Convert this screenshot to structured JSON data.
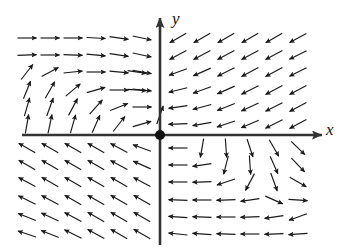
{
  "figure": {
    "type": "direction-field",
    "axes": {
      "x_label": "x",
      "y_label": "y",
      "x_axis": {
        "x1": 22,
        "y1": 135,
        "x2": 322,
        "y2": 135,
        "arrow_end": "right"
      },
      "y_axis": {
        "x1": 160,
        "y1": 245,
        "x2": 160,
        "y2": 18,
        "arrow_end": "up"
      },
      "origin": {
        "x": 160,
        "y": 135
      }
    },
    "equilibrium_point": {
      "x": 160,
      "y": 135,
      "radius": 5,
      "color": "#111111",
      "filled": true
    },
    "colors": {
      "axis": "#333333",
      "arrow": "#1a1a1a",
      "background": "#ffffff"
    },
    "grid": {
      "q1_cols": [
        178,
        202,
        226,
        250,
        274,
        298
      ],
      "q1_rows": [
        38,
        55,
        72,
        90,
        107,
        124
      ],
      "q2_cols": [
        27,
        50,
        73,
        96,
        119,
        142
      ],
      "q2_rows": [
        38,
        55,
        72,
        90,
        107,
        124
      ],
      "q3_cols": [
        27,
        50,
        73,
        96,
        119,
        142
      ],
      "q3_rows": [
        148,
        165,
        182,
        200,
        217,
        234
      ],
      "q4_cols": [
        178,
        202,
        226,
        250,
        274,
        298
      ],
      "q4_rows": [
        148,
        165,
        182,
        200,
        217,
        234
      ]
    },
    "arrow_length": 19,
    "arrow_head_size": 5,
    "spiral_centers": [
      {
        "quadrant": "II",
        "x": 72,
        "y": 86,
        "sense": "counterclockwise"
      },
      {
        "quadrant": "IV",
        "x": 258,
        "y": 190,
        "sense": "counterclockwise"
      }
    ]
  },
  "chart_data": {
    "type": "scatter",
    "title": "",
    "xlabel": "x",
    "ylabel": "y",
    "xlim": [
      -7,
      7
    ],
    "ylim": [
      -6,
      6
    ],
    "grid": false,
    "legend": null,
    "field_vectors": [
      {
        "x": 27,
        "y": 38,
        "angle": 0
      },
      {
        "x": 50,
        "y": 38,
        "angle": 0
      },
      {
        "x": 73,
        "y": 38,
        "angle": 0
      },
      {
        "x": 96,
        "y": 38,
        "angle": 3
      },
      {
        "x": 119,
        "y": 38,
        "angle": 8
      },
      {
        "x": 142,
        "y": 38,
        "angle": 12
      },
      {
        "x": 27,
        "y": 55,
        "angle": -2
      },
      {
        "x": 50,
        "y": 55,
        "angle": 0
      },
      {
        "x": 73,
        "y": 55,
        "angle": 2
      },
      {
        "x": 96,
        "y": 55,
        "angle": 5
      },
      {
        "x": 119,
        "y": 55,
        "angle": 8
      },
      {
        "x": 142,
        "y": 55,
        "angle": 12
      },
      {
        "x": 27,
        "y": 72,
        "angle": -52
      },
      {
        "x": 50,
        "y": 72,
        "angle": -28
      },
      {
        "x": 73,
        "y": 72,
        "angle": -6
      },
      {
        "x": 96,
        "y": 72,
        "angle": 0
      },
      {
        "x": 119,
        "y": 72,
        "angle": 5
      },
      {
        "x": 142,
        "y": 72,
        "angle": 10
      },
      {
        "x": 27,
        "y": 90,
        "angle": -68
      },
      {
        "x": 50,
        "y": 90,
        "angle": -60
      },
      {
        "x": 73,
        "y": 90,
        "angle": -40
      },
      {
        "x": 96,
        "y": 90,
        "angle": -16
      },
      {
        "x": 119,
        "y": 90,
        "angle": 0
      },
      {
        "x": 142,
        "y": 90,
        "angle": 6
      },
      {
        "x": 27,
        "y": 107,
        "angle": -74
      },
      {
        "x": 50,
        "y": 107,
        "angle": -70
      },
      {
        "x": 73,
        "y": 107,
        "angle": -62
      },
      {
        "x": 96,
        "y": 107,
        "angle": -48
      },
      {
        "x": 119,
        "y": 107,
        "angle": -22
      },
      {
        "x": 142,
        "y": 107,
        "angle": 0
      },
      {
        "x": 27,
        "y": 124,
        "angle": -80
      },
      {
        "x": 50,
        "y": 124,
        "angle": -78
      },
      {
        "x": 73,
        "y": 124,
        "angle": -74
      },
      {
        "x": 96,
        "y": 124,
        "angle": -66
      },
      {
        "x": 119,
        "y": 124,
        "angle": -52
      },
      {
        "x": 142,
        "y": 124,
        "angle": -16
      },
      {
        "x": 178,
        "y": 38,
        "angle": 150
      },
      {
        "x": 202,
        "y": 38,
        "angle": 150
      },
      {
        "x": 226,
        "y": 38,
        "angle": 150
      },
      {
        "x": 250,
        "y": 38,
        "angle": 150
      },
      {
        "x": 274,
        "y": 38,
        "angle": 150
      },
      {
        "x": 298,
        "y": 38,
        "angle": 152
      },
      {
        "x": 178,
        "y": 55,
        "angle": 152
      },
      {
        "x": 202,
        "y": 55,
        "angle": 152
      },
      {
        "x": 226,
        "y": 55,
        "angle": 152
      },
      {
        "x": 250,
        "y": 55,
        "angle": 152
      },
      {
        "x": 274,
        "y": 55,
        "angle": 152
      },
      {
        "x": 298,
        "y": 55,
        "angle": 154
      },
      {
        "x": 178,
        "y": 72,
        "angle": 160
      },
      {
        "x": 202,
        "y": 72,
        "angle": 156
      },
      {
        "x": 226,
        "y": 72,
        "angle": 154
      },
      {
        "x": 250,
        "y": 72,
        "angle": 152
      },
      {
        "x": 274,
        "y": 72,
        "angle": 152
      },
      {
        "x": 298,
        "y": 72,
        "angle": 154
      },
      {
        "x": 178,
        "y": 90,
        "angle": 166
      },
      {
        "x": 202,
        "y": 90,
        "angle": 160
      },
      {
        "x": 226,
        "y": 90,
        "angle": 156
      },
      {
        "x": 250,
        "y": 90,
        "angle": 154
      },
      {
        "x": 274,
        "y": 90,
        "angle": 152
      },
      {
        "x": 298,
        "y": 90,
        "angle": 152
      },
      {
        "x": 178,
        "y": 107,
        "angle": 172
      },
      {
        "x": 202,
        "y": 107,
        "angle": 165
      },
      {
        "x": 226,
        "y": 107,
        "angle": 158
      },
      {
        "x": 250,
        "y": 107,
        "angle": 155
      },
      {
        "x": 274,
        "y": 107,
        "angle": 153
      },
      {
        "x": 298,
        "y": 107,
        "angle": 152
      },
      {
        "x": 178,
        "y": 124,
        "angle": 178
      },
      {
        "x": 202,
        "y": 124,
        "angle": 170
      },
      {
        "x": 226,
        "y": 124,
        "angle": 162
      },
      {
        "x": 250,
        "y": 124,
        "angle": 157
      },
      {
        "x": 274,
        "y": 124,
        "angle": 154
      },
      {
        "x": 298,
        "y": 124,
        "angle": 152
      },
      {
        "x": 27,
        "y": 148,
        "angle": -150
      },
      {
        "x": 50,
        "y": 148,
        "angle": -150
      },
      {
        "x": 73,
        "y": 148,
        "angle": -150
      },
      {
        "x": 96,
        "y": 148,
        "angle": -150
      },
      {
        "x": 119,
        "y": 148,
        "angle": -152
      },
      {
        "x": 142,
        "y": 148,
        "angle": -160
      },
      {
        "x": 27,
        "y": 165,
        "angle": -150
      },
      {
        "x": 50,
        "y": 165,
        "angle": -150
      },
      {
        "x": 73,
        "y": 165,
        "angle": -150
      },
      {
        "x": 96,
        "y": 165,
        "angle": -150
      },
      {
        "x": 119,
        "y": 165,
        "angle": -152
      },
      {
        "x": 142,
        "y": 165,
        "angle": -156
      },
      {
        "x": 27,
        "y": 182,
        "angle": -152
      },
      {
        "x": 50,
        "y": 182,
        "angle": -150
      },
      {
        "x": 73,
        "y": 182,
        "angle": -150
      },
      {
        "x": 96,
        "y": 182,
        "angle": -150
      },
      {
        "x": 119,
        "y": 182,
        "angle": -150
      },
      {
        "x": 142,
        "y": 182,
        "angle": -152
      },
      {
        "x": 27,
        "y": 200,
        "angle": -154
      },
      {
        "x": 50,
        "y": 200,
        "angle": -152
      },
      {
        "x": 73,
        "y": 200,
        "angle": -150
      },
      {
        "x": 96,
        "y": 200,
        "angle": -150
      },
      {
        "x": 119,
        "y": 200,
        "angle": -150
      },
      {
        "x": 142,
        "y": 200,
        "angle": -150
      },
      {
        "x": 27,
        "y": 217,
        "angle": -158
      },
      {
        "x": 50,
        "y": 217,
        "angle": -155
      },
      {
        "x": 73,
        "y": 217,
        "angle": -152
      },
      {
        "x": 96,
        "y": 217,
        "angle": -150
      },
      {
        "x": 119,
        "y": 217,
        "angle": -150
      },
      {
        "x": 142,
        "y": 217,
        "angle": -150
      },
      {
        "x": 27,
        "y": 234,
        "angle": -162
      },
      {
        "x": 50,
        "y": 234,
        "angle": -158
      },
      {
        "x": 73,
        "y": 234,
        "angle": -154
      },
      {
        "x": 96,
        "y": 234,
        "angle": -151
      },
      {
        "x": 119,
        "y": 234,
        "angle": -150
      },
      {
        "x": 142,
        "y": 234,
        "angle": -150
      },
      {
        "x": 178,
        "y": 148,
        "angle": 180
      },
      {
        "x": 202,
        "y": 148,
        "angle": 100
      },
      {
        "x": 226,
        "y": 148,
        "angle": 86
      },
      {
        "x": 250,
        "y": 148,
        "angle": 72
      },
      {
        "x": 274,
        "y": 148,
        "angle": 60
      },
      {
        "x": 298,
        "y": 148,
        "angle": 44
      },
      {
        "x": 178,
        "y": 165,
        "angle": 180
      },
      {
        "x": 202,
        "y": 165,
        "angle": 172
      },
      {
        "x": 226,
        "y": 165,
        "angle": 104
      },
      {
        "x": 250,
        "y": 165,
        "angle": 86
      },
      {
        "x": 274,
        "y": 165,
        "angle": 66
      },
      {
        "x": 298,
        "y": 165,
        "angle": 46
      },
      {
        "x": 178,
        "y": 182,
        "angle": 180
      },
      {
        "x": 202,
        "y": 182,
        "angle": 178
      },
      {
        "x": 226,
        "y": 182,
        "angle": 162
      },
      {
        "x": 250,
        "y": 182,
        "angle": 118
      },
      {
        "x": 274,
        "y": 182,
        "angle": 70
      },
      {
        "x": 298,
        "y": 182,
        "angle": 30
      },
      {
        "x": 178,
        "y": 200,
        "angle": 182
      },
      {
        "x": 202,
        "y": 200,
        "angle": 180
      },
      {
        "x": 226,
        "y": 200,
        "angle": 178
      },
      {
        "x": 250,
        "y": 200,
        "angle": 172
      },
      {
        "x": 274,
        "y": 200,
        "angle": 24
      },
      {
        "x": 298,
        "y": 200,
        "angle": 4
      },
      {
        "x": 178,
        "y": 217,
        "angle": 184
      },
      {
        "x": 202,
        "y": 217,
        "angle": 182
      },
      {
        "x": 226,
        "y": 217,
        "angle": 180
      },
      {
        "x": 250,
        "y": 217,
        "angle": 178
      },
      {
        "x": 274,
        "y": 217,
        "angle": 172
      },
      {
        "x": 298,
        "y": 217,
        "angle": 160
      },
      {
        "x": 178,
        "y": 234,
        "angle": 186
      },
      {
        "x": 202,
        "y": 234,
        "angle": 184
      },
      {
        "x": 226,
        "y": 234,
        "angle": 182
      },
      {
        "x": 250,
        "y": 234,
        "angle": 180
      },
      {
        "x": 274,
        "y": 234,
        "angle": 178
      },
      {
        "x": 298,
        "y": 234,
        "angle": 176
      },
      {
        "x": 160,
        "y": 115,
        "angle": -70
      },
      {
        "x": 137,
        "y": 90,
        "angle": 4
      },
      {
        "x": 137,
        "y": 72,
        "angle": 8
      }
    ]
  }
}
